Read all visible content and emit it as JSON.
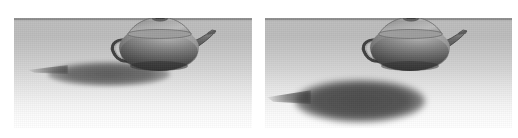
{
  "figure": {
    "background_color": "#ffffff",
    "width_px": 518,
    "height_px": 138,
    "panel_count": 2
  },
  "scene": {
    "ground_color_near_horizon": "#bcbcbc",
    "ground_color_foreground": "#ffffff",
    "wall_color": "#a9a9a9",
    "horizon_line_color": "#787878",
    "light_direction": "upper-right",
    "teapot_body_color": "#8e8e8e",
    "teapot_highlight_color": "#c9c9c9",
    "teapot_dark_color": "#4a4a4a",
    "shadow_color": "#3c3c3c"
  },
  "panels": [
    {
      "id": "panel-left",
      "label": "Left panel",
      "object": "teapot",
      "shadow_type": "attached contact shadow",
      "shadow_position": "touching teapot base, extending to the lower-left",
      "object_position": "resting on ground plane at horizon"
    },
    {
      "id": "panel-right",
      "label": "Right panel",
      "object": "teapot",
      "shadow_type": "detached cast shadow",
      "shadow_position": "separated from teapot base, offset down and to the left",
      "object_position": "appears to float above ground plane"
    }
  ],
  "objects": {
    "teapot_parts": [
      "lid-knob",
      "lid",
      "body",
      "spout",
      "handle",
      "base"
    ]
  }
}
